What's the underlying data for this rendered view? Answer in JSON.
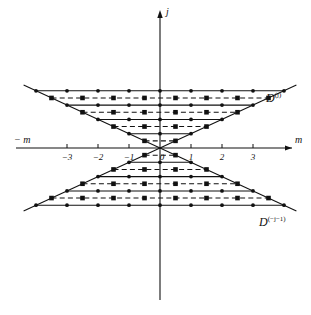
{
  "figure": {
    "axes": {
      "x_label_left": "− m",
      "x_label_right": "m",
      "y_label": "j",
      "x_ticks": [
        {
          "value": -3,
          "label": "−3"
        },
        {
          "value": -2,
          "label": "−2"
        },
        {
          "value": -1,
          "label": "−1"
        },
        {
          "value": 0,
          "label": "0"
        },
        {
          "value": 1,
          "label": "1"
        },
        {
          "value": 2,
          "label": "2"
        },
        {
          "value": 3,
          "label": "3"
        }
      ]
    },
    "regions": [
      {
        "name": "upper-region",
        "base": "D",
        "superscript": "(j)"
      },
      {
        "name": "lower-region",
        "base": "D",
        "superscript": "(−j−1)"
      }
    ],
    "colors": {
      "ink": "#111111",
      "background": "#ffffff"
    }
  },
  "chart_data": {
    "type": "scatter",
    "title": "",
    "xlabel": "m",
    "ylabel": "j",
    "xlim": [
      -4.4,
      4.4
    ],
    "ylim": [
      -4.4,
      4.4
    ],
    "grid": false,
    "legend": null,
    "marker_styles": [
      {
        "name": "integer-row",
        "line": "solid",
        "marker": "circle"
      },
      {
        "name": "half-integer-row",
        "line": "dashed",
        "marker": "square"
      }
    ],
    "series": [
      {
        "name": "upper-cone-rows",
        "region": "D^(j)",
        "rows": [
          {
            "j": 0.5,
            "line": "dashed",
            "marker": "square",
            "m": [
              -0.5,
              0.5
            ]
          },
          {
            "j": 1.0,
            "line": "solid",
            "marker": "circle",
            "m": [
              -1,
              0,
              1
            ]
          },
          {
            "j": 1.5,
            "line": "dashed",
            "marker": "square",
            "m": [
              -1.5,
              -0.5,
              0.5,
              1.5
            ]
          },
          {
            "j": 2.0,
            "line": "solid",
            "marker": "circle",
            "m": [
              -2,
              -1,
              0,
              1,
              2
            ]
          },
          {
            "j": 2.5,
            "line": "dashed",
            "marker": "square",
            "m": [
              -2.5,
              -1.5,
              -0.5,
              0.5,
              1.5,
              2.5
            ]
          },
          {
            "j": 3.0,
            "line": "solid",
            "marker": "circle",
            "m": [
              -3,
              -2,
              -1,
              0,
              1,
              2,
              3
            ]
          },
          {
            "j": 3.5,
            "line": "dashed",
            "marker": "square",
            "m": [
              -3.5,
              -2.5,
              -1.5,
              -0.5,
              0.5,
              1.5,
              2.5,
              3.5
            ]
          },
          {
            "j": 4.0,
            "line": "solid",
            "marker": "circle",
            "m": [
              -4,
              -3,
              -2,
              -1,
              0,
              1,
              2,
              3,
              4
            ]
          }
        ]
      },
      {
        "name": "lower-cone-rows",
        "region": "D^(-j-1)",
        "rows": [
          {
            "j": -0.5,
            "line": "dashed",
            "marker": "square",
            "m": [
              -0.5,
              0.5
            ]
          },
          {
            "j": -1.0,
            "line": "solid",
            "marker": "circle",
            "m": [
              -1,
              0,
              1
            ]
          },
          {
            "j": -1.5,
            "line": "dashed",
            "marker": "square",
            "m": [
              -1.5,
              -0.5,
              0.5,
              1.5
            ]
          },
          {
            "j": -2.0,
            "line": "solid",
            "marker": "circle",
            "m": [
              -2,
              -1,
              0,
              1,
              2
            ]
          },
          {
            "j": -2.5,
            "line": "dashed",
            "marker": "square",
            "m": [
              -2.5,
              -1.5,
              -0.5,
              0.5,
              1.5,
              2.5
            ]
          },
          {
            "j": -3.0,
            "line": "solid",
            "marker": "circle",
            "m": [
              -3,
              -2,
              -1,
              0,
              1,
              2,
              3
            ]
          },
          {
            "j": -3.5,
            "line": "dashed",
            "marker": "square",
            "m": [
              -3.5,
              -2.5,
              -1.5,
              -0.5,
              0.5,
              1.5,
              2.5,
              3.5
            ]
          },
          {
            "j": -4.0,
            "line": "solid",
            "marker": "circle",
            "m": [
              -4,
              -3,
              -2,
              -1,
              0,
              1,
              2,
              3,
              4
            ]
          }
        ]
      }
    ],
    "cone_boundaries": [
      {
        "name": "upper-left-edge",
        "from": [
          0,
          0
        ],
        "to": [
          -4.4,
          4.4
        ]
      },
      {
        "name": "upper-right-edge",
        "from": [
          0,
          0
        ],
        "to": [
          4.4,
          4.4
        ]
      },
      {
        "name": "lower-left-edge",
        "from": [
          0,
          0
        ],
        "to": [
          -4.4,
          -4.4
        ]
      },
      {
        "name": "lower-right-edge",
        "from": [
          0,
          0
        ],
        "to": [
          4.4,
          -4.4
        ]
      }
    ]
  }
}
